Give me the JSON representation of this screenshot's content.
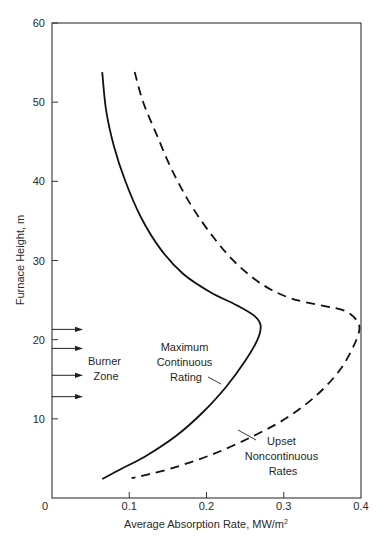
{
  "chart_data": {
    "type": "line",
    "title": "",
    "xlabel": "Average Absorption Rate, MW/m",
    "xlabel_superscript": "2",
    "ylabel": "Furnace Height, m",
    "xlim": [
      0,
      0.4
    ],
    "ylim": [
      0,
      60
    ],
    "grid": false,
    "legend": "none (inline annotations)",
    "x_ticks": [
      0,
      0.1,
      0.2,
      0.3,
      0.4
    ],
    "x_tick_labels": [
      "0",
      "0.1",
      "0.2",
      "0.3",
      "0.4"
    ],
    "y_ticks": [
      10,
      20,
      30,
      40,
      50,
      60
    ],
    "y_tick_labels": [
      "10",
      "20",
      "30",
      "40",
      "50",
      "60"
    ],
    "series": [
      {
        "name": "Maximum Continuous Rating",
        "style": "solid",
        "color": "#111111",
        "points": [
          [
            0.065,
            53.8
          ],
          [
            0.07,
            49.0
          ],
          [
            0.08,
            44.5
          ],
          [
            0.095,
            40.0
          ],
          [
            0.115,
            35.5
          ],
          [
            0.14,
            31.5
          ],
          [
            0.17,
            28.3
          ],
          [
            0.205,
            26.0
          ],
          [
            0.24,
            24.3
          ],
          [
            0.262,
            23.0
          ],
          [
            0.27,
            21.8
          ],
          [
            0.266,
            20.0
          ],
          [
            0.25,
            17.3
          ],
          [
            0.225,
            14.0
          ],
          [
            0.195,
            10.8
          ],
          [
            0.16,
            7.8
          ],
          [
            0.12,
            5.2
          ],
          [
            0.09,
            3.7
          ],
          [
            0.065,
            2.4
          ]
        ]
      },
      {
        "name": "Upset Noncontinuous Rates",
        "style": "dashed",
        "color": "#111111",
        "points": [
          [
            0.107,
            53.8
          ],
          [
            0.118,
            50.0
          ],
          [
            0.135,
            46.0
          ],
          [
            0.155,
            41.5
          ],
          [
            0.18,
            37.0
          ],
          [
            0.21,
            32.8
          ],
          [
            0.24,
            29.5
          ],
          [
            0.275,
            26.8
          ],
          [
            0.31,
            25.2
          ],
          [
            0.35,
            24.3
          ],
          [
            0.38,
            23.6
          ],
          [
            0.397,
            22.0
          ],
          [
            0.394,
            20.0
          ],
          [
            0.375,
            16.5
          ],
          [
            0.345,
            13.2
          ],
          [
            0.305,
            10.2
          ],
          [
            0.26,
            7.8
          ],
          [
            0.21,
            5.6
          ],
          [
            0.16,
            3.9
          ],
          [
            0.125,
            3.0
          ],
          [
            0.103,
            2.5
          ]
        ]
      }
    ],
    "annotations": [
      {
        "text_lines": [
          "Maximum",
          "Continuous",
          "Rating"
        ],
        "target_series": "Maximum Continuous Rating"
      },
      {
        "text_lines": [
          "Upset",
          "Noncontinuous",
          "Rates"
        ],
        "target_series": "Upset Noncontinuous Rates"
      },
      {
        "text_lines": [
          "Burner",
          "Zone"
        ],
        "arrows_at_heights": [
          21.3,
          18.9,
          15.5,
          12.8
        ]
      }
    ]
  },
  "labels": {
    "burner_line1": "Burner",
    "burner_line2": "Zone",
    "mcr_line1": "Maximum",
    "mcr_line2": "Continuous",
    "mcr_line3": "Rating",
    "upset_line1": "Upset",
    "upset_line2": "Noncontinuous",
    "upset_line3": "Rates"
  }
}
